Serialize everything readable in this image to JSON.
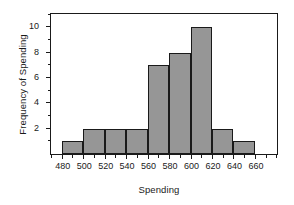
{
  "chart_data": {
    "type": "bar",
    "title": "",
    "subtitle": "",
    "xlabel": "Spending",
    "ylabel": "Frequency of Spending",
    "bin_width": 20,
    "bin_edges": [
      480,
      500,
      520,
      540,
      560,
      580,
      600,
      620,
      640,
      660
    ],
    "categories": [
      "480-500",
      "500-520",
      "520-540",
      "540-560",
      "560-580",
      "580-600",
      "600-620",
      "620-640",
      "640-660"
    ],
    "values": [
      1,
      2,
      2,
      2,
      7,
      8,
      10,
      2,
      1
    ],
    "xlim": [
      470,
      680
    ],
    "ylim": [
      0,
      11
    ],
    "xticks": [
      480,
      500,
      520,
      540,
      560,
      580,
      600,
      620,
      640,
      660
    ],
    "xtick_labels": [
      "480",
      "500",
      "520",
      "540",
      "560",
      "580",
      "600",
      "620",
      "640",
      "660"
    ],
    "yticks": [
      2,
      4,
      6,
      8,
      10
    ],
    "ytick_labels": [
      "2",
      "4",
      "6",
      "8",
      "10"
    ],
    "yticks_minor": [
      1,
      3,
      5,
      7,
      9,
      11
    ],
    "grid": false,
    "legend": null,
    "bar_fill_color": "#969696",
    "bar_edge_color": "#1a1a1a",
    "frame_color": "#1a1a1a",
    "background_color": "#ffffff"
  }
}
